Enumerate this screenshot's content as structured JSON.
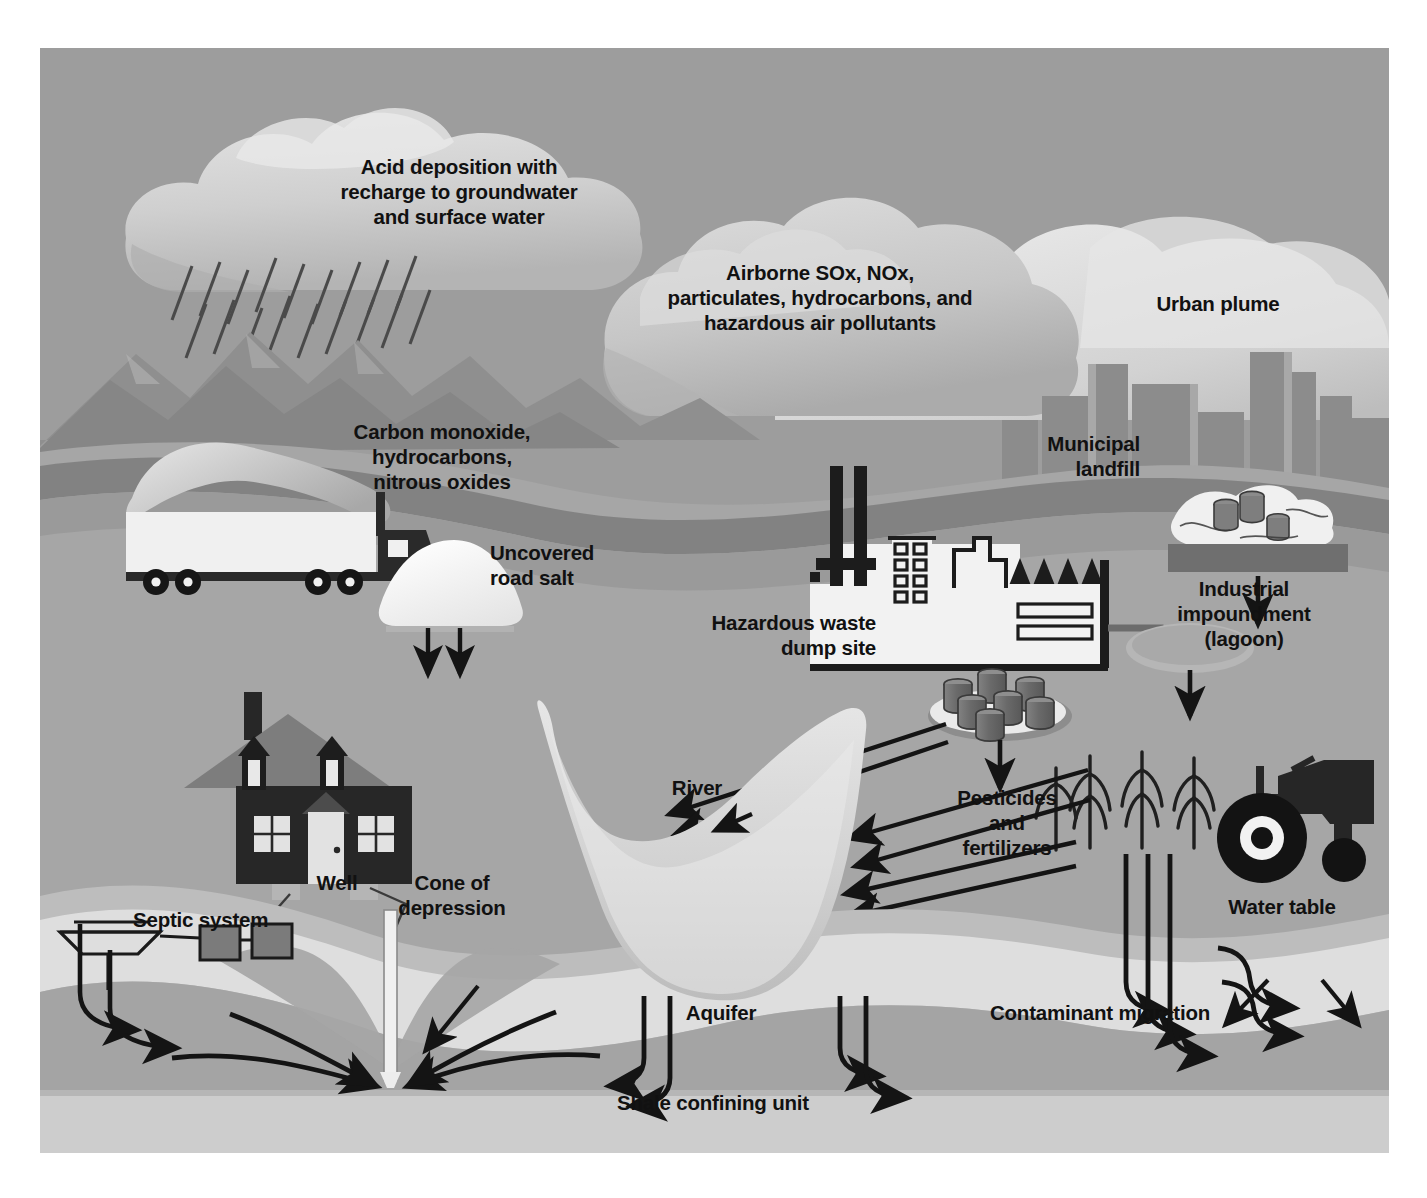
{
  "figure": {
    "background_color": "#9d9d9d",
    "page_color": "#ffffff"
  },
  "labels": {
    "acid_deposition": "Acid deposition with\nrecharge to groundwater\nand surface water",
    "airborne": "Airborne SOx, NOx,\nparticulates, hydrocarbons, and\nhazardous air pollutants",
    "urban_plume": "Urban plume",
    "vehicle_emissions": "Carbon monoxide,\nhydrocarbons,\nnitrous oxides",
    "municipal_landfill": "Municipal\nlandfill",
    "road_salt": "Uncovered\nroad salt",
    "industrial_impoundment": "Industrial\nimpoundment\n(lagoon)",
    "hazardous_waste": "Hazardous waste\ndump site",
    "river": "River",
    "pesticides": "Pesticides\nand\nfertilizers",
    "well": "Well",
    "cone_of_depression": "Cone of\ndepression",
    "septic_system": "Septic system",
    "water_table": "Water table",
    "aquifer": "Aquifer",
    "contaminant_migration": "Contaminant migration",
    "shale_confining_unit": "Shale confining unit"
  },
  "palette": {
    "sky": "#9d9d9d",
    "cloud_light": "#d6d6d6",
    "cloud_mid": "#c2c2c2",
    "cloud_dark": "#b0b0b0",
    "mountain_dark": "#8a8a8a",
    "mountain_mid": "#949494",
    "ground_upper": "#a6a6a6",
    "ground_road": "#7e7e7e",
    "unsaturated_zone": "#b8b8b8",
    "water_table_band": "#dcdcdc",
    "aquifer": "#a2a2a2",
    "shale": "#c9c9c9",
    "white_object": "#f2f2f2",
    "dark_object": "#2a2a2a",
    "ink": "#111111",
    "drum": "#6f6f6f",
    "building": "#8c8c8c"
  },
  "scene_elements": {
    "clouds": [
      "acid-rain-cloud",
      "pollution-cloud",
      "urban-plume-cloud"
    ],
    "vehicles": [
      "semi-truck",
      "tractor"
    ],
    "structures": [
      "house",
      "factory",
      "city-skyline",
      "municipal-landfill",
      "industrial-lagoon"
    ],
    "waste": [
      "hazardous-waste-drums",
      "road-salt-pile",
      "septic-system"
    ],
    "hydrology": [
      "river",
      "water-table",
      "aquifer",
      "cone-of-depression",
      "well",
      "shale-confining-unit"
    ],
    "agriculture": [
      "crop-rows"
    ],
    "rain_streaks": 18,
    "drum_count": 7,
    "skyline_building_count": 9
  }
}
